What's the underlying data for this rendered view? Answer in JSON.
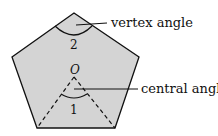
{
  "diagram": {
    "shape": "regular pentagon",
    "fill_color": "#d4d4d4",
    "stroke_color": "#111111",
    "center_label": "O",
    "angle_1_label": "1",
    "angle_2_label": "2",
    "callouts": [
      {
        "label": "vertex angle"
      },
      {
        "label": "central angle"
      }
    ]
  }
}
